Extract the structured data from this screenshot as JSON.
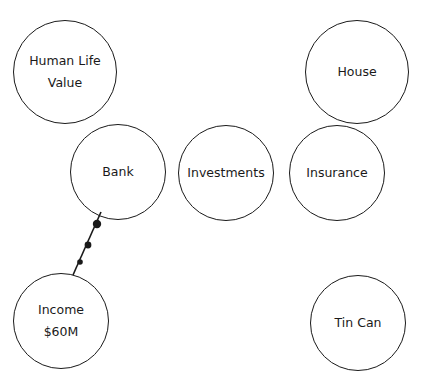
{
  "diagram": {
    "background": "#ffffff",
    "stroke_color": "#1a1a1a",
    "nodes": [
      {
        "id": "human-life-value",
        "lines": [
          "Human Life",
          "Value"
        ],
        "cx": 65,
        "cy": 72,
        "r": 52
      },
      {
        "id": "house",
        "lines": [
          "House"
        ],
        "cx": 357,
        "cy": 72,
        "r": 52
      },
      {
        "id": "bank",
        "lines": [
          "Bank"
        ],
        "cx": 118,
        "cy": 172,
        "r": 48
      },
      {
        "id": "investments",
        "lines": [
          "Investments"
        ],
        "cx": 226,
        "cy": 173,
        "r": 48
      },
      {
        "id": "insurance",
        "lines": [
          "Insurance"
        ],
        "cx": 337,
        "cy": 173,
        "r": 48
      },
      {
        "id": "income",
        "lines": [
          "Income",
          "$60M"
        ],
        "cx": 61,
        "cy": 321,
        "r": 48
      },
      {
        "id": "tin-can",
        "lines": [
          "Tin Can"
        ],
        "cx": 358,
        "cy": 323,
        "r": 48
      }
    ],
    "connectors": [
      {
        "from": "bank",
        "to": "income",
        "x1": 101,
        "y1": 212,
        "x2": 73,
        "y2": 275,
        "dots": [
          {
            "cx": 97,
            "cy": 224,
            "r": 4.2
          },
          {
            "cx": 88,
            "cy": 245,
            "r": 3.4
          },
          {
            "cx": 80,
            "cy": 262,
            "r": 2.8
          }
        ]
      }
    ]
  }
}
